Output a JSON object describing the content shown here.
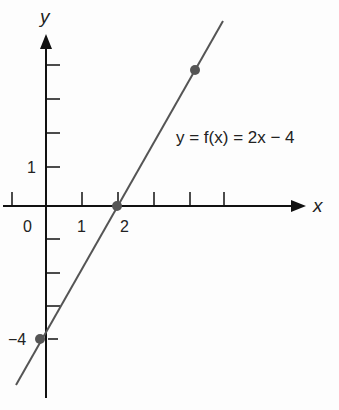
{
  "figure": {
    "function_label": "y = f(x) = 2x − 4",
    "x_axis_label": "x",
    "y_axis_label": "y",
    "origin_label": "0",
    "x_tick_labels": [
      "1",
      "2"
    ],
    "y_tick_labels": [
      "1",
      "−4"
    ],
    "points": [
      {
        "x": 0,
        "y": -4
      },
      {
        "x": 2,
        "y": 0
      },
      {
        "x": 4,
        "y": 4
      }
    ],
    "colors": {
      "line": "#555555",
      "axis": "#111111",
      "point": "#555555"
    }
  }
}
